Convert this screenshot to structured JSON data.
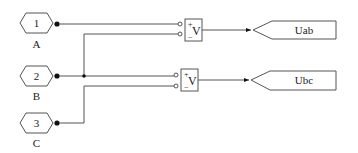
{
  "diagram": {
    "type": "simulink-block-diagram",
    "inports": [
      {
        "number": "1",
        "label": "A"
      },
      {
        "number": "2",
        "label": "B"
      },
      {
        "number": "3",
        "label": "C"
      }
    ],
    "voltmeters": [
      {
        "plus": "+",
        "symbol": "V",
        "minus": "−"
      },
      {
        "plus": "+",
        "symbol": "V",
        "minus": "−"
      }
    ],
    "goto_tags": [
      {
        "label": "Uab"
      },
      {
        "label": "Ubc"
      }
    ],
    "connections": [
      "A -> Voltmeter1(+)",
      "B -> Voltmeter1(-)",
      "B -> Voltmeter2(+)",
      "C -> Voltmeter2(-)",
      "Voltmeter1 -> Uab",
      "Voltmeter2 -> Ubc"
    ],
    "colors": {
      "line": "#555555",
      "background": "#ffffff",
      "text": "#222222"
    }
  }
}
